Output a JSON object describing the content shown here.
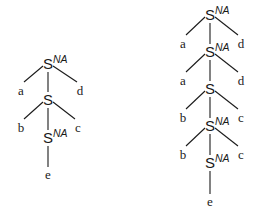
{
  "trees": [
    {
      "name": "left-tree",
      "nodes": [
        {
          "id": "l0",
          "label": "S",
          "sup": "NA",
          "type": "nonterminal"
        },
        {
          "id": "l1",
          "label": "a",
          "type": "terminal"
        },
        {
          "id": "l2",
          "label": "S",
          "sup": "",
          "type": "nonterminal"
        },
        {
          "id": "l3",
          "label": "d",
          "type": "terminal"
        },
        {
          "id": "l4",
          "label": "b",
          "type": "terminal"
        },
        {
          "id": "l5",
          "label": "S",
          "sup": "NA",
          "type": "nonterminal"
        },
        {
          "id": "l6",
          "label": "c",
          "type": "terminal"
        },
        {
          "id": "l7",
          "label": "e",
          "type": "terminal"
        }
      ],
      "edges": [
        [
          "l0",
          "l1"
        ],
        [
          "l0",
          "l2"
        ],
        [
          "l0",
          "l3"
        ],
        [
          "l2",
          "l4"
        ],
        [
          "l2",
          "l5"
        ],
        [
          "l2",
          "l6"
        ],
        [
          "l5",
          "l7"
        ]
      ]
    },
    {
      "name": "right-tree",
      "nodes": [
        {
          "id": "r0",
          "label": "S",
          "sup": "NA",
          "type": "nonterminal"
        },
        {
          "id": "r1",
          "label": "a",
          "type": "terminal"
        },
        {
          "id": "r2",
          "label": "S",
          "sup": "NA",
          "type": "nonterminal"
        },
        {
          "id": "r3",
          "label": "d",
          "type": "terminal"
        },
        {
          "id": "r4",
          "label": "a",
          "type": "terminal"
        },
        {
          "id": "r5",
          "label": "S",
          "sup": "",
          "type": "nonterminal"
        },
        {
          "id": "r6",
          "label": "d",
          "type": "terminal"
        },
        {
          "id": "r7",
          "label": "b",
          "type": "terminal"
        },
        {
          "id": "r8",
          "label": "S",
          "sup": "NA",
          "type": "nonterminal"
        },
        {
          "id": "r9",
          "label": "c",
          "type": "terminal"
        },
        {
          "id": "r10",
          "label": "b",
          "type": "terminal"
        },
        {
          "id": "r11",
          "label": "S",
          "sup": "NA",
          "type": "nonterminal"
        },
        {
          "id": "r12",
          "label": "c",
          "type": "terminal"
        },
        {
          "id": "r13",
          "label": "e",
          "type": "terminal"
        }
      ],
      "edges": [
        [
          "r0",
          "r1"
        ],
        [
          "r0",
          "r2"
        ],
        [
          "r0",
          "r3"
        ],
        [
          "r2",
          "r4"
        ],
        [
          "r2",
          "r5"
        ],
        [
          "r2",
          "r6"
        ],
        [
          "r5",
          "r7"
        ],
        [
          "r5",
          "r8"
        ],
        [
          "r5",
          "r9"
        ],
        [
          "r8",
          "r10"
        ],
        [
          "r8",
          "r11"
        ],
        [
          "r8",
          "r12"
        ],
        [
          "r11",
          "r13"
        ]
      ]
    }
  ]
}
